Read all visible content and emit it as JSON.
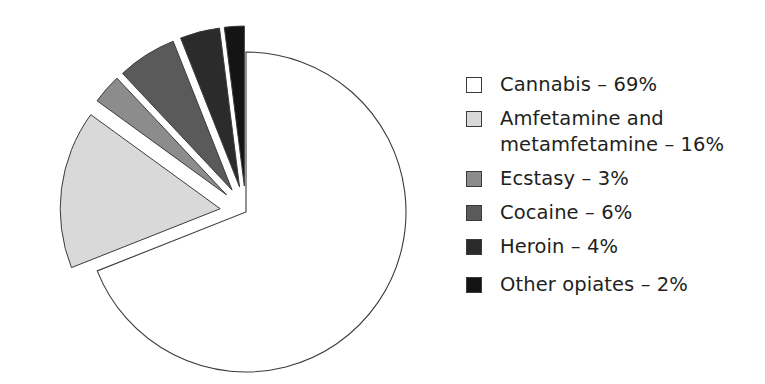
{
  "chart_data": {
    "type": "pie",
    "title": "",
    "subtitle": "",
    "xlabel": "",
    "ylabel": "",
    "grid": false,
    "legend_position": "right",
    "units": "%",
    "categories": [
      "Cannabis",
      "Amfetamine and metamfetamine",
      "Ecstasy",
      "Cocaine",
      "Heroin",
      "Other opiates"
    ],
    "values": [
      69,
      16,
      3,
      6,
      4,
      2
    ],
    "colors": [
      "#ffffff",
      "#d9d9d9",
      "#8c8c8c",
      "#5a5a5a",
      "#2b2b2b",
      "#141414"
    ],
    "slice_outline_color": "#3b3b3b",
    "exploded": [
      false,
      true,
      true,
      true,
      true,
      true
    ],
    "slices": [
      {
        "label": "Cannabis",
        "value": 69,
        "display_value": "69%",
        "color": "#ffffff",
        "exploded": false
      },
      {
        "label": "Amfetamine and metamfetamine",
        "value": 16,
        "display_value": "16%",
        "color": "#d9d9d9",
        "exploded": true
      },
      {
        "label": "Ecstasy",
        "value": 3,
        "display_value": "3%",
        "color": "#8c8c8c",
        "exploded": true
      },
      {
        "label": "Cocaine",
        "value": 6,
        "display_value": "6%",
        "color": "#5a5a5a",
        "exploded": true
      },
      {
        "label": "Heroin",
        "value": 4,
        "display_value": "4%",
        "color": "#2b2b2b",
        "exploded": true
      },
      {
        "label": "Other opiates",
        "value": 2,
        "display_value": "2%",
        "color": "#141414",
        "exploded": true
      }
    ]
  },
  "legend": {
    "items": [
      {
        "swatch_color": "#ffffff",
        "text": "Cannabis – 69%",
        "name": "cannabis"
      },
      {
        "swatch_color": "#d9d9d9",
        "text": "Amfetamine and\nmetamfetamine – 16%",
        "name": "amfetamine-and-metamfetamine"
      },
      {
        "swatch_color": "#8c8c8c",
        "text": "Ecstasy – 3%",
        "name": "ecstasy"
      },
      {
        "swatch_color": "#5a5a5a",
        "text": "Cocaine – 6%",
        "name": "cocaine"
      },
      {
        "swatch_color": "#2b2b2b",
        "text": "Heroin – 4%",
        "name": "heroin"
      },
      {
        "swatch_color": "#141414",
        "text": "Other opiates – 2%",
        "name": "other-opiates"
      }
    ]
  }
}
